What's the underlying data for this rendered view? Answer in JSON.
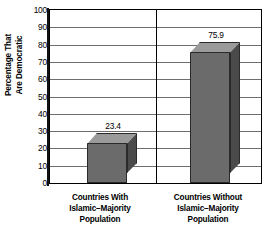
{
  "chart_data": {
    "type": "bar",
    "title": "",
    "xlabel": "",
    "ylabel": "Percentage That Are Democratic",
    "ylabel_lines": [
      "Percentage That",
      "Are Democratic"
    ],
    "categories": [
      "Countries With Islamic–Majority Population",
      "Countries Without Islamic–Majority Population"
    ],
    "category_lines": [
      [
        "Countries With",
        "Islamic–Majority",
        "Population"
      ],
      [
        "Countries Without",
        "Islamic–Majority",
        "Population"
      ]
    ],
    "values": [
      23.4,
      75.9
    ],
    "value_labels": [
      "23.4",
      "75.9"
    ],
    "ylim": [
      0,
      100
    ],
    "ytick_step": 10,
    "yticks": [
      "0",
      "10",
      "20",
      "30",
      "40",
      "50",
      "60",
      "70",
      "80",
      "90",
      "100"
    ],
    "grid": true,
    "legend": "none",
    "style": "3d-bar",
    "colors": {
      "bar_front": "#6b6b6b",
      "bar_side": "#4a4a4a",
      "bar_top": "#9a9a9a",
      "bar_outline": "#2a2a2a",
      "gridline": "#6e6e6e",
      "axis": "#000000",
      "background": "#ffffff",
      "text": "#000000"
    }
  }
}
